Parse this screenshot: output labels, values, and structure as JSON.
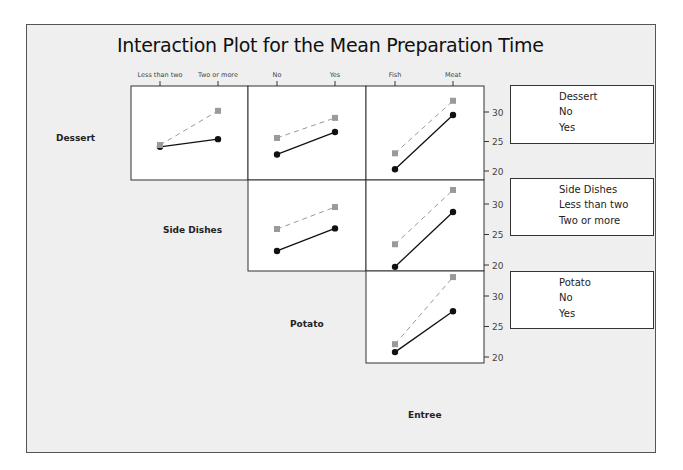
{
  "chart_data": {
    "type": "line",
    "title": "Interaction Plot for the Mean Preparation Time",
    "layout": "matrix of interaction plots (upper triangle)",
    "factors": [
      {
        "name": "Dessert",
        "levels": [
          "No",
          "Yes"
        ]
      },
      {
        "name": "Side Dishes",
        "levels": [
          "Less than two",
          "Two or more"
        ]
      },
      {
        "name": "Potato",
        "levels": [
          "No",
          "Yes"
        ]
      },
      {
        "name": "Entree",
        "levels": [
          "Fish",
          "Meat"
        ]
      }
    ],
    "column_factors": [
      {
        "name": "Side Dishes",
        "tick_labels": [
          "Less than two",
          "Two or more"
        ]
      },
      {
        "name": "Potato",
        "tick_labels": [
          "No",
          "Yes"
        ]
      },
      {
        "name": "Entree",
        "tick_labels": [
          "Fish",
          "Meat"
        ]
      }
    ],
    "row_factors": [
      "Dessert",
      "Side Dishes",
      "Potato"
    ],
    "column_axis_label": "Entree",
    "y_ticks": [
      20,
      25,
      30
    ],
    "ylim": [
      18.5,
      34.5
    ],
    "panels": [
      {
        "row": "Dessert",
        "col": "Side Dishes",
        "x": [
          "Less than two",
          "Two or more"
        ],
        "series": [
          {
            "name": "No",
            "values": [
              24.1,
              25.4
            ]
          },
          {
            "name": "Yes",
            "values": [
              24.4,
              30.2
            ]
          }
        ]
      },
      {
        "row": "Dessert",
        "col": "Potato",
        "x": [
          "No",
          "Yes"
        ],
        "series": [
          {
            "name": "No",
            "values": [
              22.8,
              26.6
            ]
          },
          {
            "name": "Yes",
            "values": [
              25.6,
              29.0
            ]
          }
        ]
      },
      {
        "row": "Dessert",
        "col": "Entree",
        "x": [
          "Fish",
          "Meat"
        ],
        "series": [
          {
            "name": "No",
            "values": [
              20.3,
              29.5
            ]
          },
          {
            "name": "Yes",
            "values": [
              23.0,
              31.9
            ]
          }
        ]
      },
      {
        "row": "Side Dishes",
        "col": "Potato",
        "x": [
          "No",
          "Yes"
        ],
        "series": [
          {
            "name": "Less than two",
            "values": [
              22.3,
              26.0
            ]
          },
          {
            "name": "Two or more",
            "values": [
              25.9,
              29.5
            ]
          }
        ]
      },
      {
        "row": "Side Dishes",
        "col": "Entree",
        "x": [
          "Fish",
          "Meat"
        ],
        "series": [
          {
            "name": "Less than two",
            "values": [
              19.7,
              28.7
            ]
          },
          {
            "name": "Two or more",
            "values": [
              23.4,
              32.3
            ]
          }
        ]
      },
      {
        "row": "Potato",
        "col": "Entree",
        "x": [
          "Fish",
          "Meat"
        ],
        "series": [
          {
            "name": "No",
            "values": [
              20.8,
              27.5
            ]
          },
          {
            "name": "Yes",
            "values": [
              22.1,
              33.1
            ]
          }
        ]
      }
    ],
    "legends": [
      {
        "title": "Dessert",
        "entries": [
          "No",
          "Yes"
        ]
      },
      {
        "title": "Side Dishes",
        "entries": [
          "Less than two",
          "Two or more"
        ]
      },
      {
        "title": "Potato",
        "entries": [
          "No",
          "Yes"
        ]
      }
    ],
    "series_styles": {
      "first_level": {
        "color": "#111111",
        "marker": "circle",
        "line": "solid"
      },
      "second_level": {
        "color": "#9a9a9a",
        "marker": "square",
        "line": "dashed"
      }
    },
    "grid": false
  },
  "labels": {
    "title": "Interaction Plot for the Mean Preparation Time",
    "row_dessert": "Dessert",
    "row_side": "Side Dishes",
    "row_potato": "Potato",
    "col_entree": "Entree"
  },
  "legend": {
    "dessert": {
      "title": "Dessert",
      "a": "No",
      "b": "Yes"
    },
    "side": {
      "title": "Side Dishes",
      "a": "Less than two",
      "b": "Two or more"
    },
    "potato": {
      "title": "Potato",
      "a": "No",
      "b": "Yes"
    }
  },
  "colors": {
    "frame_bg": "#efefef",
    "panel_bg": "#ffffff",
    "series1": "#111111",
    "series2": "#9a9a9a"
  }
}
